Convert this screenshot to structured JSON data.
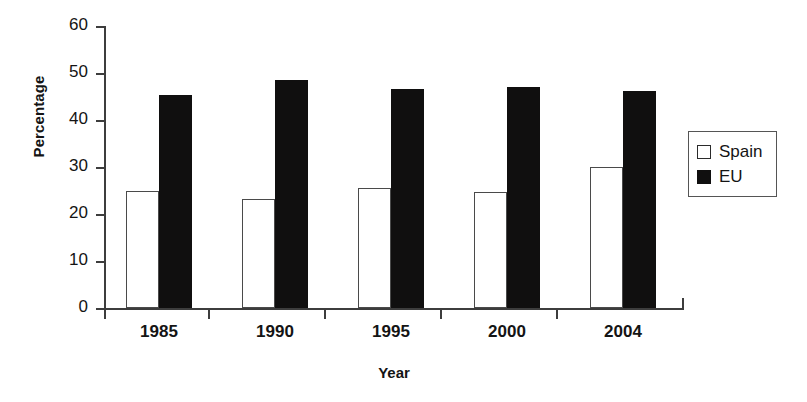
{
  "chart_data": {
    "type": "bar",
    "title": "",
    "xlabel": "Year",
    "ylabel": "Percentage",
    "categories": [
      "1985",
      "1990",
      "1995",
      "2000",
      "2004"
    ],
    "series": [
      {
        "name": "Spain",
        "values": [
          25.0,
          23.3,
          25.6,
          24.7,
          30.1
        ],
        "color": "#ffffff"
      },
      {
        "name": "EU",
        "values": [
          45.3,
          48.5,
          46.7,
          47.0,
          46.1
        ],
        "color": "#100f0f"
      }
    ],
    "ylim": [
      0,
      60
    ],
    "yticks": [
      "0",
      "10",
      "20",
      "30",
      "40",
      "50",
      "60"
    ],
    "grid": false,
    "legend_position": "right"
  },
  "legend": {
    "items": [
      {
        "label": "Spain",
        "swatch": "open-square-swatch"
      },
      {
        "label": "EU",
        "swatch": "filled-square-swatch"
      }
    ]
  }
}
